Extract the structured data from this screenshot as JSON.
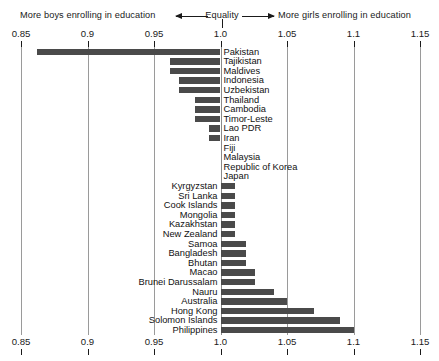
{
  "header": {
    "left_text": "More boys enrolling in education",
    "center_text": "Equality",
    "right_text": "More girls enrolling in education",
    "left_arrow_icon": "arrow-left-icon",
    "right_arrow_icon": "arrow-right-icon"
  },
  "axis": {
    "ticks": [
      "0.85",
      "0.9",
      "0.95",
      "1.0",
      "1.05",
      "1.1",
      "1.15"
    ],
    "tick_values": [
      0.85,
      0.9,
      0.95,
      1.0,
      1.05,
      1.1,
      1.15
    ]
  },
  "colors": {
    "bar": "#4a4a4a",
    "gridline": "#9a9a9a",
    "background": "#ffffff",
    "text": "#1a1a1a"
  },
  "chart_data": {
    "type": "bar",
    "orientation": "horizontal",
    "title": "",
    "subtitle": "",
    "xlabel": "",
    "ylabel": "",
    "xlim": [
      0.85,
      1.15
    ],
    "baseline": 1.0,
    "grid": true,
    "legend": null,
    "annotations": [
      "More boys enrolling in education",
      "Equality",
      "More girls enrolling in education"
    ],
    "categories": [
      "Pakistan",
      "Tajikistan",
      "Maldives",
      "Indonesia",
      "Uzbekistan",
      "Thailand",
      "Cambodia",
      "Timor-Leste",
      "Lao PDR",
      "Iran",
      "Fiji",
      "Malaysia",
      "Republic of Korea",
      "Japan",
      "Kyrgyzstan",
      "Sri Lanka",
      "Cook Islands",
      "Mongolia",
      "Kazakhstan",
      "New Zealand",
      "Samoa",
      "Bangladesh",
      "Bhutan",
      "Macao",
      "Brunei Darussalam",
      "Nauru",
      "Australia",
      "Hong Kong",
      "Solomon Islands",
      "Philippines"
    ],
    "values": [
      0.862,
      0.962,
      0.962,
      0.969,
      0.969,
      0.981,
      0.981,
      0.981,
      0.991,
      0.991,
      1.0,
      1.0,
      1.0,
      1.0,
      1.011,
      1.011,
      1.011,
      1.011,
      1.011,
      1.011,
      1.019,
      1.019,
      1.019,
      1.026,
      1.026,
      1.04,
      1.05,
      1.07,
      1.09,
      1.1
    ]
  }
}
